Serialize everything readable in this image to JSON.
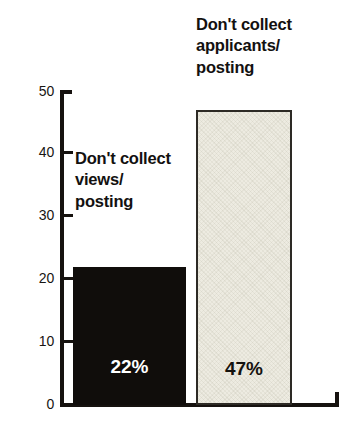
{
  "chart_data": {
    "type": "bar",
    "title": "",
    "subtitle": "",
    "xlabel": "",
    "ylabel": "",
    "ylim": [
      0,
      50
    ],
    "yticks": [
      0,
      10,
      20,
      30,
      40,
      50
    ],
    "ytick_labels": [
      "0",
      "10",
      "20",
      "30",
      "40",
      "50"
    ],
    "grid": false,
    "legend": null,
    "orientation": "vertical",
    "categories": [
      "Don't collect\nviews/\nposting",
      "Don't collect\napplicants/\nposting"
    ],
    "values": [
      22,
      47
    ],
    "data_labels": [
      "22%",
      "47%"
    ],
    "series": [
      {
        "name": "Percent of employers",
        "values": [
          22,
          47
        ]
      }
    ],
    "bar_styles": [
      {
        "fill": "#100d0b",
        "text_color": "#ffffff",
        "label": "solid-black"
      },
      {
        "fill": "#edebe1",
        "text_color": "#15120f",
        "label": "textured-light",
        "border": "#2d2a25"
      }
    ]
  },
  "axis": {
    "y_tick_0": "0",
    "y_tick_1": "10",
    "y_tick_2": "20",
    "y_tick_3": "30",
    "y_tick_4": "40",
    "y_tick_5": "50"
  },
  "colors": {
    "background": "#ffffff",
    "axis": "#16120f",
    "bar_dark": "#100d0b",
    "bar_light": "#edebe1",
    "bar_light_border": "#2d2a25",
    "text": "#131110"
  }
}
